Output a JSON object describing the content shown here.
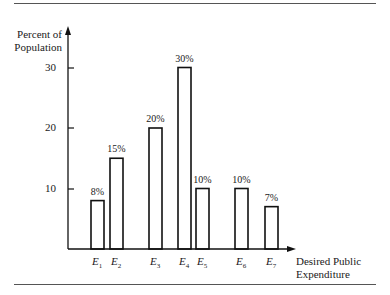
{
  "chart_data": {
    "type": "bar",
    "title": "",
    "xlabel": "Desired Public Expenditure",
    "ylabel": "Percent of Population",
    "categories": [
      "E1",
      "E2",
      "E3",
      "E4",
      "E5",
      "E6",
      "E7"
    ],
    "values": [
      8,
      15,
      20,
      30,
      10,
      10,
      7
    ],
    "value_labels": [
      "8%",
      "15%",
      "20%",
      "30%",
      "10%",
      "10%",
      "7%"
    ],
    "yticks": [
      10,
      20,
      30
    ],
    "ylim": [
      0,
      33
    ],
    "grid": false,
    "legend": null
  },
  "axis": {
    "ylabel_line1": "Percent of",
    "ylabel_line2": "Population",
    "xlabel_line1": "Desired Public",
    "xlabel_line2": "Expenditure",
    "ytick_labels": [
      "10",
      "20",
      "30"
    ]
  }
}
